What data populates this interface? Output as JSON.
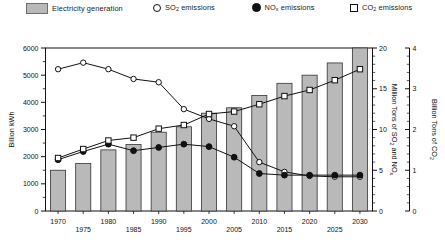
{
  "legend": {
    "items": [
      {
        "label": "Electricity generation",
        "marker": "gray-swatch"
      },
      {
        "label": "SO",
        "sub": "2",
        "label2": " emissions",
        "marker": "open-circle"
      },
      {
        "label": "NO",
        "sub": "x",
        "label2": " emissions",
        "marker": "filled-circle"
      },
      {
        "label": "CO",
        "sub": "2",
        "label2": " emissions",
        "marker": "open-square"
      }
    ]
  },
  "axes": {
    "left_title_a": "Billion kWh",
    "right1_title_a": "Million Tons",
    "right1_title_b": "of SO",
    "right1_title_b_sub": "2",
    "right1_title_c": "and NO",
    "right1_title_c_sub": "x",
    "right2_title_a": "Billion Tons",
    "right2_title_b": "of CO",
    "right2_title_b_sub": "2"
  },
  "chart_data": {
    "type": "bar",
    "title": "",
    "xlabel": "",
    "ylabel": "Billion kWh",
    "ylim": [
      0,
      6000
    ],
    "yticks": [
      0,
      1000,
      2000,
      3000,
      4000,
      5000,
      6000
    ],
    "y2label": "Million Tons of SO2 and NOx",
    "y2lim": [
      0,
      20
    ],
    "y2ticks": [
      0,
      5,
      10,
      15,
      20
    ],
    "y3label": "Billion Tons of CO2",
    "y3lim": [
      0,
      4
    ],
    "y3ticks": [
      0,
      1,
      2,
      3,
      4
    ],
    "grid": false,
    "legend_position": "top",
    "categories": [
      1970,
      1975,
      1980,
      1985,
      1990,
      1995,
      2000,
      2005,
      2010,
      2015,
      2020,
      2025,
      2030
    ],
    "xtick_labels": [
      "1970",
      "1975",
      "1980",
      "1985",
      "1990",
      "1995",
      "2000",
      "2005",
      "2010",
      "2015",
      "2020",
      "2025",
      "2030"
    ],
    "series": [
      {
        "name": "Electricity generation",
        "type": "bar",
        "axis": "left",
        "unit": "Billion kWh",
        "values": [
          1500,
          1750,
          2250,
          2450,
          2900,
          3100,
          3600,
          3800,
          4250,
          4700,
          5000,
          5450,
          6000
        ]
      },
      {
        "name": "SO2 emissions",
        "type": "line",
        "marker": "open-circle",
        "axis": "right1",
        "unit": "Million Tons",
        "values": [
          17.4,
          18.2,
          17.4,
          16.2,
          15.8,
          12.5,
          11.3,
          10.4,
          6.0,
          4.8,
          4.3,
          4.2,
          4.2
        ]
      },
      {
        "name": "NOx emissions",
        "type": "line",
        "marker": "filled-circle",
        "axis": "right1",
        "unit": "Million Tons",
        "values": [
          6.3,
          7.3,
          8.2,
          7.4,
          7.8,
          8.2,
          7.9,
          6.6,
          4.6,
          4.4,
          4.4,
          4.4,
          4.4
        ]
      },
      {
        "name": "CO2 emissions",
        "type": "line",
        "marker": "open-square",
        "axis": "right2",
        "unit": "Billion Tons",
        "values": [
          1.3,
          1.52,
          1.73,
          1.8,
          2.02,
          2.11,
          2.38,
          2.44,
          2.62,
          2.82,
          2.97,
          3.21,
          3.48
        ]
      }
    ]
  }
}
